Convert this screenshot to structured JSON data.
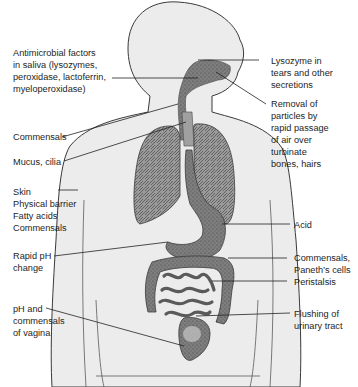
{
  "diagram": {
    "left_labels": [
      {
        "id": "saliva",
        "text": "Antimicrobial factors\nin saliva (lysozymes,\nperoxidase, lactoferrin,\nmyeloperoxidase)"
      },
      {
        "id": "commensals-throat",
        "text": "Commensals"
      },
      {
        "id": "mucus",
        "text": "Mucus, cilia"
      },
      {
        "id": "skin",
        "text": "Skin\nPhysical barrier\nFatty acids\nCommensals"
      },
      {
        "id": "ph-change",
        "text": "Rapid pH\nchange"
      },
      {
        "id": "vagina",
        "text": "pH and\ncommensals\nof vagina"
      }
    ],
    "right_labels": [
      {
        "id": "tears",
        "text": "Lysozyme in\ntears and other\nsecretions"
      },
      {
        "id": "nasal",
        "text": "Removal of\nparticles by\nrapid passage\nof air over\nturbinate\nbones, hairs"
      },
      {
        "id": "acid",
        "text": "Acid"
      },
      {
        "id": "paneth",
        "text": "Commensals,\nPaneth’s cells"
      },
      {
        "id": "peristalsis",
        "text": "Peristalsis"
      },
      {
        "id": "urinary",
        "text": "Flushing of\nurinary tract"
      }
    ],
    "colors": {
      "body_fill": "#ececec",
      "outline": "#3a3a3a",
      "organ_fill": "#8a8a8a",
      "organ_dark": "#5a5a5a",
      "leader_line": "#222222"
    }
  }
}
